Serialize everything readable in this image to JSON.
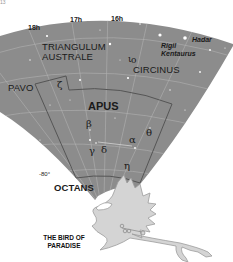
{
  "page_number": "13",
  "colors": {
    "sky": "#8c8c8c",
    "sky_dark": "#7e7e7e",
    "grid": "#b4b4b4",
    "boundary": "#5a5a5a",
    "bird_fill": "#d2d2d2",
    "bird_stroke": "#9a9a9a",
    "star": "#ffffff",
    "text": "#1a1a1a"
  },
  "chart": {
    "hour_labels": [
      "18h",
      "17h",
      "16h"
    ],
    "declination_label": "-80°",
    "constellations": {
      "main": "APUS",
      "neighbors": [
        "TRIANGULUM",
        "AUSTRALE",
        "CIRCINUS",
        "PAVO",
        "OCTANS"
      ]
    },
    "star_names": [
      "Rigil",
      "Kentaurus",
      "Hadar"
    ],
    "greek_letters": {
      "zeta": "ζ",
      "beta": "β",
      "alpha": "α",
      "theta": "θ",
      "gamma": "γ",
      "delta": "δ",
      "eta": "η",
      "iota": "ι",
      "omicron": "o"
    },
    "caption_line1": "THE BIRD OF",
    "caption_line2": "PARADISE"
  }
}
